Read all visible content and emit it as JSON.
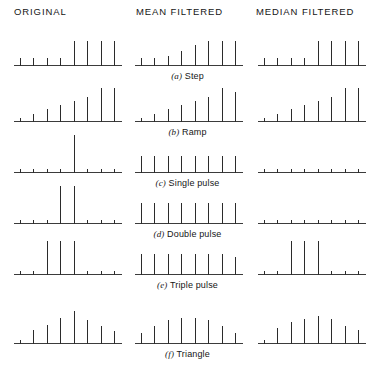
{
  "figure": {
    "columns": [
      {
        "id": "original",
        "label": "ORIGINAL"
      },
      {
        "id": "mean",
        "label": "MEAN FILTERED"
      },
      {
        "id": "median",
        "label": "MEDIAN FILTERED"
      }
    ],
    "rows": [
      {
        "id": "step",
        "letter": "(a)",
        "name": "Step"
      },
      {
        "id": "ramp",
        "letter": "(b)",
        "name": "Ramp"
      },
      {
        "id": "single-pulse",
        "letter": "(c)",
        "name": "Single pulse"
      },
      {
        "id": "double-pulse",
        "letter": "(d)",
        "name": "Double pulse"
      },
      {
        "id": "triple-pulse",
        "letter": "(e)",
        "name": "Triple pulse"
      },
      {
        "id": "triangle",
        "letter": "(f)",
        "name": "Triangle"
      }
    ],
    "colors": {
      "stem": "#2b2b2b",
      "baseline": "#3b3b3b",
      "text": "#151515",
      "background": "#ffffff"
    }
  },
  "chart_data": {
    "type": "bar",
    "subtitle": "Stem plots, 8 samples per signal, three processing columns",
    "xlabel": "",
    "ylabel": "",
    "grid": false,
    "legend": "none",
    "axis_ranges": {
      "x": [
        0,
        9
      ],
      "y": [
        0,
        10
      ]
    },
    "x": [
      1,
      2,
      3,
      4,
      5,
      6,
      7,
      8
    ],
    "columns": [
      "ORIGINAL",
      "MEAN FILTERED",
      "MEDIAN FILTERED"
    ],
    "panels": [
      {
        "row": "(a) Step",
        "series": [
          {
            "name": "ORIGINAL",
            "values": [
              2,
              2,
              2,
              2,
              6,
              6,
              6,
              6
            ]
          },
          {
            "name": "MEAN FILTERED",
            "values": [
              2,
              2,
              2.5,
              3.5,
              5,
              6,
              6,
              6
            ]
          },
          {
            "name": "MEDIAN FILTERED",
            "values": [
              2,
              2,
              2,
              2,
              6,
              6,
              6,
              6
            ]
          }
        ]
      },
      {
        "row": "(b) Ramp",
        "series": [
          {
            "name": "ORIGINAL",
            "values": [
              1,
              2,
              3,
              4,
              5,
              6,
              8,
              8
            ]
          },
          {
            "name": "MEAN FILTERED",
            "values": [
              1,
              2,
              3,
              4,
              5,
              6,
              8,
              7.2
            ]
          },
          {
            "name": "MEDIAN FILTERED",
            "values": [
              1,
              2,
              3,
              4,
              5,
              6,
              8,
              8
            ]
          }
        ]
      },
      {
        "row": "(c) Single pulse",
        "series": [
          {
            "name": "ORIGINAL",
            "values": [
              1,
              1,
              1,
              1,
              9,
              1,
              1,
              1
            ]
          },
          {
            "name": "MEAN FILTERED",
            "values": [
              4,
              4,
              4,
              4,
              4,
              4,
              4,
              4
            ]
          },
          {
            "name": "MEDIAN FILTERED",
            "values": [
              1,
              1,
              1,
              1,
              1,
              1,
              1,
              1
            ]
          }
        ]
      },
      {
        "row": "(d) Double pulse",
        "series": [
          {
            "name": "ORIGINAL",
            "values": [
              1,
              1,
              1,
              9,
              9,
              1,
              1,
              1
            ]
          },
          {
            "name": "MEAN FILTERED",
            "values": [
              5,
              5,
              5,
              5,
              5,
              5,
              5,
              5
            ]
          },
          {
            "name": "MEDIAN FILTERED",
            "values": [
              1,
              1,
              1,
              1,
              1,
              1,
              1,
              1
            ]
          }
        ]
      },
      {
        "row": "(e) Triple pulse",
        "series": [
          {
            "name": "ORIGINAL",
            "values": [
              1,
              1,
              8,
              8,
              8,
              1,
              1,
              1
            ]
          },
          {
            "name": "MEAN FILTERED",
            "values": [
              5,
              5,
              5,
              5,
              5,
              5,
              5,
              4.3
            ]
          },
          {
            "name": "MEDIAN FILTERED",
            "values": [
              1,
              1,
              8,
              8,
              8,
              1,
              1,
              1
            ]
          }
        ]
      },
      {
        "row": "(f) Triangle",
        "series": [
          {
            "name": "ORIGINAL",
            "values": [
              1,
              3.4,
              4.6,
              6.2,
              7.8,
              5.8,
              4.4,
              3.2
            ]
          },
          {
            "name": "MEAN FILTERED",
            "values": [
              2.6,
              4.2,
              5.6,
              6.2,
              6.2,
              5.6,
              4.2,
              2.6
            ]
          },
          {
            "name": "MEDIAN FILTERED",
            "values": [
              1,
              3.8,
              5.2,
              6.0,
              6.6,
              6.0,
              4.4,
              3.4
            ]
          }
        ]
      }
    ]
  }
}
